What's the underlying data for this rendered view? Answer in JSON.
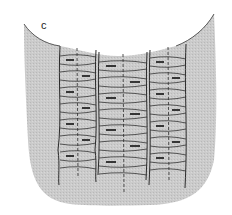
{
  "figure": {
    "panel_label": "c",
    "colors": {
      "fabric_fill": "#c9c9c9",
      "line": "#2a2a2a",
      "background": "#ffffff"
    },
    "columns": 3
  }
}
